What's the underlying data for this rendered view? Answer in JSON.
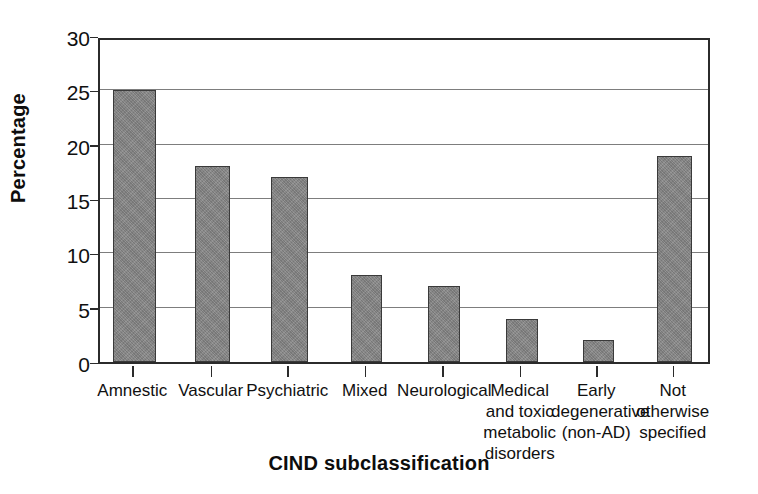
{
  "chart_data": {
    "type": "bar",
    "title": "",
    "xlabel": "CIND subclassification",
    "ylabel": "Percentage",
    "categories": [
      "Amnestic",
      "Vascular",
      "Psychiatric",
      "Mixed",
      "Neurological",
      "Medical and toxic metabolic disorders",
      "Early degenerative (non-AD)",
      "Not otherwise specified"
    ],
    "category_lines": [
      [
        "Amnestic"
      ],
      [
        "Vascular"
      ],
      [
        "Psychiatric"
      ],
      [
        "Mixed"
      ],
      [
        "Neurological"
      ],
      [
        "Medical",
        "and toxic",
        "metabolic",
        "disorders"
      ],
      [
        "Early",
        "degenerative",
        "(non-AD)"
      ],
      [
        "Not",
        "otherwise",
        "specified"
      ]
    ],
    "values": [
      25,
      18,
      17,
      8,
      7,
      4,
      2,
      19
    ],
    "ylim": [
      0,
      30
    ],
    "yticks": [
      0,
      5,
      10,
      15,
      20,
      25,
      30
    ],
    "ytick_labels": [
      "0",
      "5",
      "10",
      "15",
      "20",
      "25",
      "30"
    ],
    "grid": true,
    "legend": "none",
    "bar_color": "#828282",
    "bar_edge_color": "#3a3a3a",
    "grid_color": "#7d7d7d",
    "axis_color": "#2b2b2b",
    "background_color": "#ffffff"
  }
}
